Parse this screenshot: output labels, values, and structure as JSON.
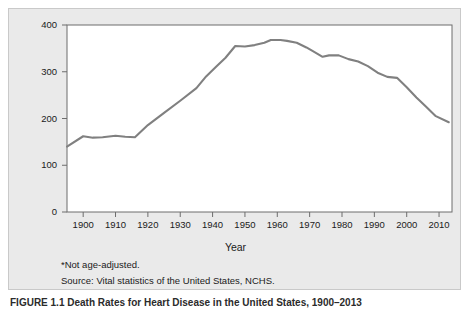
{
  "figure": {
    "footnote_asterisk": "*Not age-adjusted.",
    "source_line": "Source: Vital statistics of the United States, NCHS.",
    "caption": "FIGURE 1.1  Death Rates for Heart Disease in the United States, 1900–2013",
    "panel_background": "#eaeaea",
    "plot_background": "#ffffff",
    "line_color": "#808080",
    "axis_color": "#555555"
  },
  "chart_data": {
    "type": "line",
    "title": "",
    "xlabel": "Year",
    "ylabel": "Deaths per 100,000 Population",
    "xlim": [
      1895,
      2014
    ],
    "ylim": [
      0,
      400
    ],
    "grid": false,
    "legend": null,
    "ytick_labels": [
      "0",
      "100",
      "200",
      "300",
      "400"
    ],
    "ytick_values": [
      0,
      100,
      200,
      300,
      400
    ],
    "xtick_labels": [
      "1900",
      "1910",
      "1920",
      "1930",
      "1940",
      "1950",
      "1960",
      "1970",
      "1980",
      "1990",
      "2000",
      "2010"
    ],
    "xtick_values": [
      1900,
      1910,
      1920,
      1930,
      1940,
      1950,
      1960,
      1970,
      1980,
      1990,
      2000,
      2010
    ],
    "series": [
      {
        "name": "Heart disease death rate",
        "x": [
          1895,
          1900,
          1903,
          1906,
          1910,
          1913,
          1916,
          1920,
          1925,
          1930,
          1935,
          1938,
          1941,
          1944,
          1947,
          1950,
          1953,
          1956,
          1958,
          1961,
          1963,
          1966,
          1969,
          1971,
          1974,
          1976,
          1979,
          1982,
          1985,
          1988,
          1991,
          1994,
          1997,
          2000,
          2003,
          2006,
          2009,
          2013
        ],
        "y": [
          140,
          162,
          159,
          160,
          163,
          161,
          160,
          186,
          212,
          238,
          265,
          290,
          310,
          330,
          355,
          354,
          357,
          362,
          368,
          368,
          366,
          362,
          352,
          344,
          332,
          335,
          335,
          327,
          322,
          312,
          298,
          289,
          287,
          267,
          245,
          225,
          205,
          192
        ]
      }
    ]
  }
}
